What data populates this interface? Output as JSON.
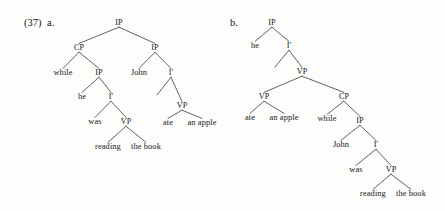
{
  "example": {
    "number": "(37)",
    "tree_a_label": "a.",
    "tree_b_label": "b."
  },
  "tree_a": {
    "name": "subordinate-clause-adjunction-tree",
    "nodes": [
      {
        "id": "a-ip-root",
        "label": "IP",
        "x": 119,
        "y": 23,
        "kind": "cat"
      },
      {
        "id": "a-cp",
        "label": "CP",
        "x": 79,
        "y": 48,
        "kind": "cat"
      },
      {
        "id": "a-ip-matrix",
        "label": "IP",
        "x": 155,
        "y": 48,
        "kind": "cat"
      },
      {
        "id": "a-while",
        "label": "while",
        "x": 63,
        "y": 73,
        "kind": "leaf"
      },
      {
        "id": "a-ip-sub",
        "label": "IP",
        "x": 99,
        "y": 73,
        "kind": "cat"
      },
      {
        "id": "a-john",
        "label": "John",
        "x": 139,
        "y": 73,
        "kind": "leaf"
      },
      {
        "id": "a-ibar-m",
        "label": "I'",
        "x": 171,
        "y": 73,
        "kind": "cat"
      },
      {
        "id": "a-he",
        "label": "he",
        "x": 82,
        "y": 97,
        "kind": "leaf"
      },
      {
        "id": "a-ibar-s",
        "label": "I'",
        "x": 111,
        "y": 97,
        "kind": "cat"
      },
      {
        "id": "a-vp-m",
        "label": "VP",
        "x": 182,
        "y": 106,
        "kind": "cat"
      },
      {
        "id": "a-was",
        "label": "was",
        "x": 95,
        "y": 122,
        "kind": "leaf"
      },
      {
        "id": "a-vp-s",
        "label": "VP",
        "x": 126,
        "y": 122,
        "kind": "cat"
      },
      {
        "id": "a-ate",
        "label": "ate",
        "x": 168,
        "y": 123,
        "kind": "leaf"
      },
      {
        "id": "a-anapple",
        "label": "an apple",
        "x": 202,
        "y": 123,
        "kind": "leaf"
      },
      {
        "id": "a-reading",
        "label": "reading",
        "x": 108,
        "y": 147,
        "kind": "leaf"
      },
      {
        "id": "a-thebook",
        "label": "the book",
        "x": 146,
        "y": 147,
        "kind": "leaf"
      }
    ],
    "edges": [
      {
        "from": "a-ip-root",
        "to": "a-cp"
      },
      {
        "from": "a-ip-root",
        "to": "a-ip-matrix"
      },
      {
        "from": "a-cp",
        "to": "a-while"
      },
      {
        "from": "a-cp",
        "to": "a-ip-sub"
      },
      {
        "from": "a-ip-matrix",
        "to": "a-john"
      },
      {
        "from": "a-ip-matrix",
        "to": "a-ibar-m"
      },
      {
        "from": "a-ip-sub",
        "to": "a-he"
      },
      {
        "from": "a-ip-sub",
        "to": "a-ibar-s"
      },
      {
        "from": "a-ibar-m",
        "to": "a-vp-m"
      },
      {
        "from": "a-ibar-s",
        "to": "a-was"
      },
      {
        "from": "a-ibar-s",
        "to": "a-vp-s"
      },
      {
        "from": "a-vp-m",
        "to": "a-ate"
      },
      {
        "from": "a-vp-m",
        "to": "a-anapple"
      },
      {
        "from": "a-vp-s",
        "to": "a-reading"
      },
      {
        "from": "a-vp-s",
        "to": "a-thebook"
      }
    ],
    "stub_edges": [
      {
        "from": "a-ibar-m",
        "dx": -14,
        "dy": 22
      }
    ]
  },
  "tree_b": {
    "name": "subordinate-clause-vp-adjunction-tree",
    "nodes": [
      {
        "id": "b-ip-root",
        "label": "IP",
        "x": 272,
        "y": 23,
        "kind": "cat"
      },
      {
        "id": "b-he",
        "label": "he",
        "x": 255,
        "y": 46,
        "kind": "leaf"
      },
      {
        "id": "b-ibar",
        "label": "I'",
        "x": 289,
        "y": 46,
        "kind": "cat"
      },
      {
        "id": "b-vp-top",
        "label": "VP",
        "x": 302,
        "y": 72,
        "kind": "cat"
      },
      {
        "id": "b-vp-left",
        "label": "VP",
        "x": 264,
        "y": 97,
        "kind": "cat"
      },
      {
        "id": "b-cp",
        "label": "CP",
        "x": 344,
        "y": 97,
        "kind": "cat"
      },
      {
        "id": "b-ate",
        "label": "ate",
        "x": 250,
        "y": 118,
        "kind": "leaf"
      },
      {
        "id": "b-anapple",
        "label": "an apple",
        "x": 284,
        "y": 118,
        "kind": "leaf"
      },
      {
        "id": "b-while",
        "label": "while",
        "x": 327,
        "y": 119,
        "kind": "leaf"
      },
      {
        "id": "b-ip-sub",
        "label": "IP",
        "x": 360,
        "y": 121,
        "kind": "cat"
      },
      {
        "id": "b-john",
        "label": "John",
        "x": 341,
        "y": 145,
        "kind": "leaf"
      },
      {
        "id": "b-ibar-sub",
        "label": "I'",
        "x": 376,
        "y": 145,
        "kind": "cat"
      },
      {
        "id": "b-was",
        "label": "was",
        "x": 356,
        "y": 170,
        "kind": "leaf"
      },
      {
        "id": "b-vp-sub",
        "label": "VP",
        "x": 391,
        "y": 170,
        "kind": "cat"
      },
      {
        "id": "b-reading",
        "label": "reading",
        "x": 373,
        "y": 194,
        "kind": "leaf"
      },
      {
        "id": "b-thebook",
        "label": "the book",
        "x": 411,
        "y": 194,
        "kind": "leaf"
      }
    ],
    "edges": [
      {
        "from": "b-ip-root",
        "to": "b-he"
      },
      {
        "from": "b-ip-root",
        "to": "b-ibar"
      },
      {
        "from": "b-ibar",
        "to": "b-vp-top"
      },
      {
        "from": "b-vp-top",
        "to": "b-vp-left"
      },
      {
        "from": "b-vp-top",
        "to": "b-cp"
      },
      {
        "from": "b-vp-left",
        "to": "b-ate"
      },
      {
        "from": "b-vp-left",
        "to": "b-anapple"
      },
      {
        "from": "b-cp",
        "to": "b-while"
      },
      {
        "from": "b-cp",
        "to": "b-ip-sub"
      },
      {
        "from": "b-ip-sub",
        "to": "b-john"
      },
      {
        "from": "b-ip-sub",
        "to": "b-ibar-sub"
      },
      {
        "from": "b-ibar-sub",
        "to": "b-was"
      },
      {
        "from": "b-ibar-sub",
        "to": "b-vp-sub"
      },
      {
        "from": "b-vp-sub",
        "to": "b-reading"
      },
      {
        "from": "b-vp-sub",
        "to": "b-thebook"
      }
    ],
    "stub_edges": [
      {
        "from": "b-ibar",
        "dx": -14,
        "dy": 21
      }
    ]
  }
}
